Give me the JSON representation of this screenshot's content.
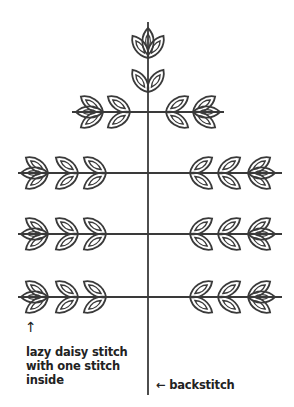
{
  "diagram": {
    "stroke_color": "#3a3a3a",
    "labels": {
      "lazy_daisy_arrow": "↑",
      "lazy_daisy": "lazy daisy stitch with one stitch inside",
      "lazy_daisy_lines": [
        "lazy daisy stitch",
        "with one stitch",
        "inside"
      ],
      "backstitch": "← backstitch"
    },
    "stem": {
      "x": 148,
      "top": 22,
      "bottom": 395
    },
    "branches": [
      {
        "y": 112,
        "x1": 72,
        "x2": 224,
        "leaves_per_side": 2
      },
      {
        "y": 173,
        "x1": 18,
        "x2": 282,
        "leaves_per_side": 3
      },
      {
        "y": 234,
        "x1": 18,
        "x2": 282,
        "leaves_per_side": 3
      },
      {
        "y": 297,
        "x1": 18,
        "x2": 282,
        "leaves_per_side": 3
      }
    ]
  }
}
